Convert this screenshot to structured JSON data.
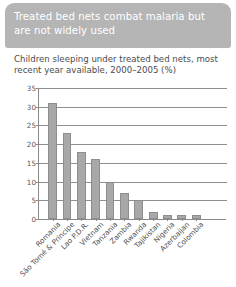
{
  "header": {
    "title": "Treated bed nets combat malaria but are not widely used",
    "background_color": "#b5b5b5",
    "text_color": "#ffffff"
  },
  "chart_data": {
    "type": "bar",
    "title": "Children sleeping under treated bed nets, most recent year available, 2000–2005 (%)",
    "xlabel": "",
    "ylabel": "",
    "ylim": [
      0,
      35
    ],
    "yticks": [
      0,
      5,
      10,
      15,
      20,
      25,
      30,
      35
    ],
    "ytick_labels": [
      "0",
      "5",
      "10",
      "15",
      "20",
      "25",
      "30",
      "35"
    ],
    "grid": true,
    "legend": false,
    "bar_color": "#a8a8a8",
    "bar_edge_color": "#8d8d8d",
    "categories": [
      "Romania",
      "São Tomé & Príncipe",
      "Lao P.D.R.",
      "Vietnam",
      "Tanzania",
      "Zambia",
      "Rwanda",
      "Tajikistan",
      "Nigeria",
      "Azerbaijan",
      "Colombia"
    ],
    "values": [
      31,
      23,
      18,
      16,
      10,
      7,
      5,
      2,
      1,
      1,
      1
    ]
  }
}
